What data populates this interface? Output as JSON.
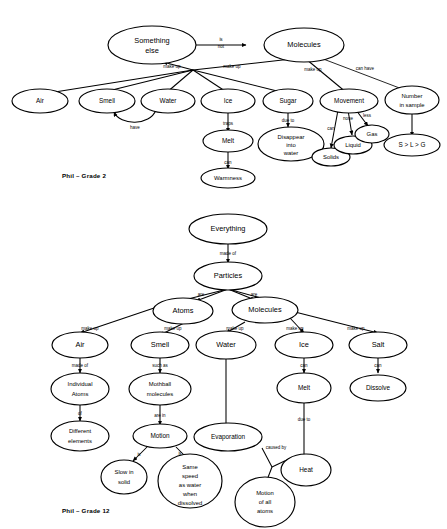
{
  "figure": {
    "ink_color": "#000000",
    "background_color": "#ffffff"
  },
  "maps": [
    {
      "id": "grade2",
      "caption": "Phil – Grade 2",
      "nodes": {
        "something_else": "Something\nelse",
        "molecules": "Molecules",
        "air": "Air",
        "smell": "Smell",
        "water": "Water",
        "ice": "Ice",
        "sugar": "Sugar",
        "movement": "Movement",
        "number_in_sample": "Number\nin sample",
        "melt": "Melt",
        "warmness": "Warmness",
        "disappear_into_water": "Disappear\ninto\nwater",
        "solids": "Solids",
        "liquid": "Liquid",
        "gas": "Gas",
        "inequality": "S > L > G"
      },
      "links": [
        {
          "from": "something_else",
          "to": "molecules",
          "label": "is\nnot"
        },
        {
          "from": "molecules",
          "to": "something_else",
          "label": "make up"
        },
        {
          "from": "molecules",
          "to": "air",
          "label": "make up"
        },
        {
          "from": "molecules",
          "to": "smell",
          "label": "make up"
        },
        {
          "from": "molecules",
          "to": "water",
          "label": "make up"
        },
        {
          "from": "molecules",
          "to": "ice",
          "label": "make up"
        },
        {
          "from": "molecules",
          "to": "sugar",
          "label": "make up"
        },
        {
          "from": "molecules",
          "to": "movement",
          "label": "can have"
        },
        {
          "from": "molecules",
          "to": "number_in_sample",
          "label": "have"
        },
        {
          "from": "water",
          "to": "smell",
          "label": "traps"
        },
        {
          "from": "ice",
          "to": "melt",
          "label": "can"
        },
        {
          "from": "melt",
          "to": "warmness",
          "label": "due to"
        },
        {
          "from": "sugar",
          "to": "disappear_into_water",
          "label": "can"
        },
        {
          "from": "movement",
          "to": "solids",
          "label": "none"
        },
        {
          "from": "movement",
          "to": "liquid",
          "label": "less"
        },
        {
          "from": "movement",
          "to": "gas",
          "label": "most"
        },
        {
          "from": "number_in_sample",
          "to": "inequality",
          "label": "such\nthat"
        }
      ]
    },
    {
      "id": "grade12",
      "caption": "Phil – Grade 12",
      "nodes": {
        "everything": "Everything",
        "particles": "Particles",
        "atoms": "Atoms",
        "molecules": "Molecules",
        "air": "Air",
        "smell": "Smell",
        "water": "Water",
        "ice": "Ice",
        "salt": "Salt",
        "individual_atoms": "Individual\nAtoms",
        "different_elements": "Different\nelements",
        "mothball_molecules": "Mothball\nmolecules",
        "motion": "Motion",
        "slow_in_solid": "Slow in\nsolid",
        "same_speed": "Same\nspeed\nas water\nwhen\ndissolved",
        "evaporation": "Evaporation",
        "motion_of_all_atoms": "Motion\nof all\natoms",
        "melt": "Melt",
        "heat": "Heat",
        "dissolve": "Dissolve"
      },
      "links": [
        {
          "from": "everything",
          "to": "particles",
          "label": "made of"
        },
        {
          "from": "particles",
          "to": "atoms",
          "label": "are"
        },
        {
          "from": "particles",
          "to": "molecules",
          "label": "are"
        },
        {
          "from": "atoms",
          "to": "air",
          "label": "make up"
        },
        {
          "from": "atoms",
          "to": "smell",
          "label": "make up"
        },
        {
          "from": "molecules",
          "to": "water",
          "label": "make up"
        },
        {
          "from": "molecules",
          "to": "ice",
          "label": "make up"
        },
        {
          "from": "molecules",
          "to": "salt",
          "label": "make up"
        },
        {
          "from": "air",
          "to": "individual_atoms",
          "label": "made of"
        },
        {
          "from": "individual_atoms",
          "to": "different_elements",
          "label": "of"
        },
        {
          "from": "smell",
          "to": "mothball_molecules",
          "label": "such as"
        },
        {
          "from": "mothball_molecules",
          "to": "motion",
          "label": "are in"
        },
        {
          "from": "motion",
          "to": "slow_in_solid",
          "label": "is"
        },
        {
          "from": "motion",
          "to": "same_speed",
          "label": "is"
        },
        {
          "from": "water",
          "to": "evaporation",
          "label": ""
        },
        {
          "from": "evaporation",
          "to": "heat",
          "label": "caused by"
        },
        {
          "from": "evaporation",
          "to": "motion_of_all_atoms",
          "label": ""
        },
        {
          "from": "ice",
          "to": "melt",
          "label": "can"
        },
        {
          "from": "melt",
          "to": "heat",
          "label": "due to"
        },
        {
          "from": "salt",
          "to": "dissolve",
          "label": "can"
        }
      ]
    }
  ]
}
